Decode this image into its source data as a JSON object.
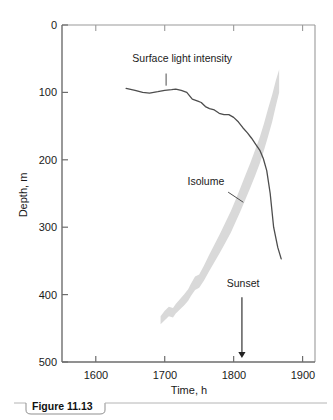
{
  "figure": {
    "caption_label": "Figure 11.13",
    "background_color": "#ffffff"
  },
  "chart_data": {
    "type": "line",
    "title": "",
    "xlabel": "Time, h",
    "ylabel": "Depth, m",
    "xlim": [
      1551,
      1918
    ],
    "ylim": [
      0,
      500
    ],
    "y_axis_inverted": true,
    "grid": false,
    "legend": "none",
    "xticks": [
      1600,
      1700,
      1800,
      1900
    ],
    "xtick_labels": [
      "1600",
      "1700",
      "1800",
      "1900"
    ],
    "yticks": [
      0,
      100,
      200,
      300,
      400,
      500
    ],
    "ytick_labels": [
      "0",
      "100",
      "200",
      "300",
      "400",
      "500"
    ],
    "colors": {
      "curve": "#4d4d4d",
      "band": "#d9d9d9",
      "axis": "#6d6d6d"
    },
    "series": [
      {
        "name": "Surface light intensity",
        "type": "line",
        "x": [
          1644,
          1657,
          1668,
          1678,
          1690,
          1700,
          1710,
          1716,
          1724,
          1732,
          1740,
          1748,
          1753,
          1759,
          1765,
          1772,
          1779,
          1786,
          1793,
          1800,
          1807,
          1813,
          1820,
          1826,
          1832,
          1838,
          1843,
          1848,
          1853,
          1858,
          1864,
          1869
        ],
        "y": [
          94,
          97,
          100,
          101,
          99,
          97,
          96,
          95,
          97,
          100,
          110,
          113,
          115,
          121,
          124,
          126,
          131,
          133,
          133,
          137,
          144,
          152,
          160,
          168,
          177,
          186,
          198,
          216,
          250,
          300,
          330,
          347
        ]
      },
      {
        "name": "Isolume",
        "type": "band",
        "upper_x": [
          1694,
          1700,
          1706,
          1712,
          1716,
          1722,
          1728,
          1734,
          1738,
          1744,
          1750,
          1757,
          1764,
          1772,
          1780,
          1788,
          1796,
          1803,
          1810,
          1817,
          1824,
          1831,
          1838,
          1844,
          1850,
          1856,
          1861,
          1866
        ],
        "upper_y": [
          432,
          424,
          418,
          420,
          414,
          407,
          400,
          392,
          384,
          373,
          370,
          357,
          342,
          326,
          310,
          293,
          276,
          259,
          241,
          223,
          205,
          186,
          166,
          146,
          124,
          103,
          83,
          66
        ],
        "lower_x": [
          1694,
          1700,
          1706,
          1712,
          1716,
          1722,
          1728,
          1734,
          1738,
          1744,
          1750,
          1757,
          1764,
          1772,
          1780,
          1788,
          1796,
          1803,
          1810,
          1817,
          1824,
          1831,
          1838,
          1844,
          1850,
          1856,
          1861,
          1866
        ],
        "lower_y": [
          444,
          438,
          432,
          434,
          428,
          422,
          416,
          409,
          402,
          393,
          390,
          379,
          366,
          352,
          338,
          323,
          308,
          292,
          276,
          259,
          242,
          224,
          205,
          186,
          165,
          143,
          121,
          100
        ]
      }
    ],
    "annotations": [
      {
        "name": "surface-light-intensity",
        "text": "Surface light intensity",
        "label_x": 1653,
        "label_y": 55,
        "leader_from_x": 1702,
        "leader_from_y": 72,
        "leader_to_x": 1702,
        "leader_to_y": 90
      },
      {
        "name": "isolume",
        "text": "Isolume",
        "label_x": 1733,
        "label_y": 237,
        "leader_from_x": 1792,
        "leader_from_y": 248,
        "leader_to_x": 1814,
        "leader_to_y": 263
      },
      {
        "name": "sunset",
        "text": "Sunset",
        "label_x": 1790,
        "label_y": 389,
        "arrow_x": 1812,
        "arrow_from_y": 404,
        "arrow_to_y": 494
      }
    ]
  }
}
